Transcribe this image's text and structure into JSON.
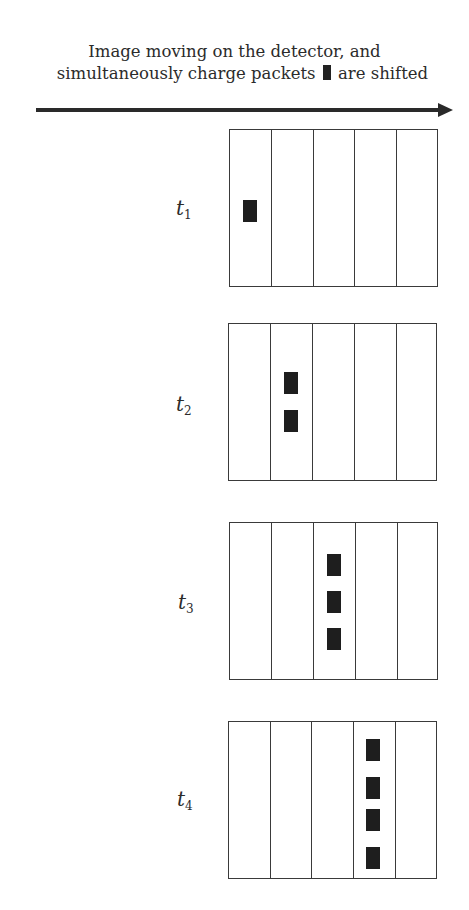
{
  "caption": {
    "line1": "Image moving on the detector, and",
    "line2_before": "simultaneously charge packets",
    "line2_after": "are shifted",
    "inline_icon": "charge-packet-icon"
  },
  "arrow": {
    "direction": "right",
    "meaning": "direction of image motion and charge shift"
  },
  "panels": [
    {
      "label": "t",
      "subscript": "1",
      "columns": 5,
      "packet_column": 1,
      "packet_count": 1
    },
    {
      "label": "t",
      "subscript": "2",
      "columns": 5,
      "packet_column": 2,
      "packet_count": 2
    },
    {
      "label": "t",
      "subscript": "3",
      "columns": 5,
      "packet_column": 3,
      "packet_count": 3
    },
    {
      "label": "t",
      "subscript": "4",
      "columns": 5,
      "packet_column": 4,
      "packet_count": 4
    }
  ],
  "colors": {
    "ink": "#2b2b2b",
    "packet": "#1e1e1e",
    "background": "#ffffff"
  }
}
